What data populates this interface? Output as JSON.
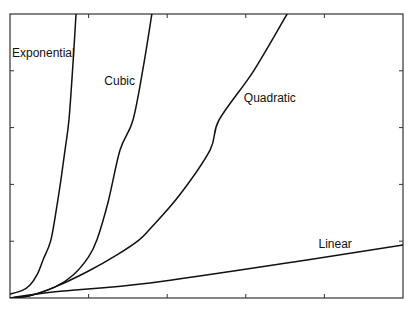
{
  "chart_data": {
    "type": "line",
    "title": "",
    "xlabel": "",
    "ylabel": "",
    "xlim": [
      0,
      10
    ],
    "ylim": [
      0,
      100
    ],
    "grid": false,
    "legend": "inline labels",
    "x_ticks_count": 4,
    "y_ticks_count": 4,
    "tick_labels": "none",
    "series": [
      {
        "name": "Exponential",
        "label_pos": [
          0.05,
          85
        ],
        "points": [
          [
            0,
            1.4
          ],
          [
            0.3,
            2.6
          ],
          [
            0.51,
            4.6
          ],
          [
            0.7,
            8.5
          ],
          [
            0.84,
            13.4
          ],
          [
            1.04,
            20.4
          ],
          [
            1.2,
            33
          ],
          [
            1.3,
            42
          ],
          [
            1.4,
            52.1
          ],
          [
            1.5,
            62.7
          ],
          [
            1.6,
            82
          ],
          [
            1.68,
            100
          ]
        ]
      },
      {
        "name": "Cubic",
        "label_pos": [
          2.4,
          75
        ],
        "points": [
          [
            0,
            0
          ],
          [
            0.5,
            0.8
          ],
          [
            1.15,
            3.9
          ],
          [
            1.6,
            8
          ],
          [
            2.0,
            14.5
          ],
          [
            2.21,
            20.4
          ],
          [
            2.5,
            34
          ],
          [
            2.8,
            52.1
          ],
          [
            3.13,
            62.7
          ],
          [
            3.4,
            82
          ],
          [
            3.61,
            100
          ]
        ]
      },
      {
        "name": "Quadratic",
        "label_pos": [
          5.95,
          69
        ],
        "points": [
          [
            0,
            0
          ],
          [
            0.5,
            0.8
          ],
          [
            1.15,
            3.9
          ],
          [
            2.0,
            9.5
          ],
          [
            2.7,
            15
          ],
          [
            3.28,
            20.4
          ],
          [
            3.56,
            24.3
          ],
          [
            4.3,
            36
          ],
          [
            5.09,
            52.1
          ],
          [
            5.32,
            62.7
          ],
          [
            6.2,
            80
          ],
          [
            7.05,
            100
          ]
        ]
      },
      {
        "name": "Linear",
        "label_pos": [
          7.85,
          17.5
        ],
        "points": [
          [
            0,
            0
          ],
          [
            1.15,
            2.2
          ],
          [
            3.56,
            5.3
          ],
          [
            7.38,
            13.0
          ],
          [
            10,
            18.7
          ]
        ]
      }
    ]
  }
}
